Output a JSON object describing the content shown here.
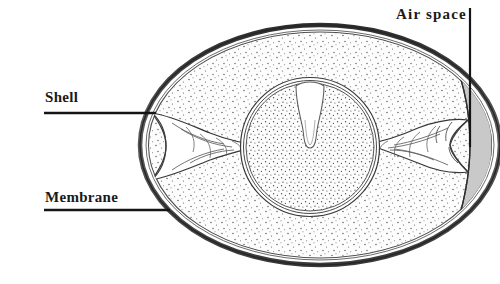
{
  "figure": {
    "background_color": "#ffffff",
    "width": 500,
    "height": 284
  },
  "labels": [
    {
      "id": "shell",
      "text": "Shell",
      "x": 45,
      "y": 90,
      "leader": {
        "x1": 44,
        "y1": 113,
        "x2": 155,
        "y2": 113
      }
    },
    {
      "id": "membrane",
      "text": "Membrane",
      "x": 45,
      "y": 190,
      "leader": {
        "x1": 44,
        "y1": 210,
        "x2": 168,
        "y2": 210
      }
    },
    {
      "id": "airspace",
      "text": "Air space",
      "x": 396,
      "y": 7,
      "leader": {
        "x1": 470,
        "y1": 8,
        "x2": 470,
        "y2": 147
      }
    }
  ],
  "parts": {
    "shell": {
      "name": "Shell",
      "color": "#4a4a4a"
    },
    "shell_membrane": {
      "name": "Shell membrane",
      "color": "#555555"
    },
    "albumen": {
      "name": "Albumen (egg white)",
      "color": "#fcfcfc",
      "texture": "stipple"
    },
    "yolk": {
      "name": "Yolk",
      "color": "#fdfdfd",
      "texture": "stipple"
    },
    "latebra": {
      "name": "Latebra",
      "color": "#ffffff"
    },
    "chalaza_left": {
      "name": "Chalaza (left)",
      "color": "#ffffff"
    },
    "chalaza_right": {
      "name": "Chalaza (right)",
      "color": "#ffffff"
    },
    "air_space": {
      "name": "Air space",
      "color": "#c9c9c9"
    }
  },
  "geometry": {
    "egg": {
      "cx": 320,
      "cy": 145,
      "rx": 180,
      "ry": 120
    },
    "yolk": {
      "cx": 310,
      "cy": 147,
      "r": 68
    },
    "air_space": {
      "side": "right"
    }
  },
  "colors": {
    "ink": "#1a1a1a",
    "shell_dark": "#3f3f3f",
    "shell_mid": "#6e6e6e",
    "air_gray": "#c9c9c9",
    "stipple": "#5a5a5a"
  }
}
